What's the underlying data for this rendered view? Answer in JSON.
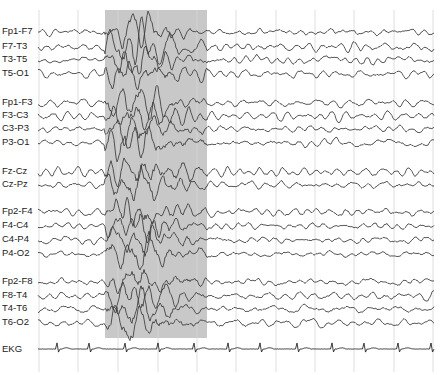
{
  "figure": {
    "type": "eeg-montage",
    "background": "#ffffff",
    "trace_color": "#3a3a3a",
    "gridline_color": "#d6d6d6",
    "highlight_color": "#c8c8c8",
    "highlight_region": {
      "x_start": 105,
      "x_end": 207,
      "y_start": 10,
      "y_end": 338
    },
    "trace_x_start": 38,
    "trace_x_end": 434,
    "gridlines_x": [
      39,
      78,
      118,
      158,
      197,
      236,
      276,
      315,
      354,
      394,
      433
    ],
    "gridline_y_start": 10,
    "gridline_y_end": 372
  },
  "channels": [
    {
      "label": "Fp1-F7",
      "y": 32,
      "group": "left-temporal"
    },
    {
      "label": "F7-T3",
      "y": 47,
      "group": "left-temporal"
    },
    {
      "label": "T3-T5",
      "y": 60,
      "group": "left-temporal"
    },
    {
      "label": "T5-O1",
      "y": 74,
      "group": "left-temporal"
    },
    {
      "label": "Fp1-F3",
      "y": 103,
      "group": "left-parasagittal"
    },
    {
      "label": "F3-C3",
      "y": 116,
      "group": "left-parasagittal"
    },
    {
      "label": "C3-P3",
      "y": 129,
      "group": "left-parasagittal"
    },
    {
      "label": "P3-O1",
      "y": 143,
      "group": "left-parasagittal"
    },
    {
      "label": "Fz-Cz",
      "y": 172,
      "group": "midline"
    },
    {
      "label": "Cz-Pz",
      "y": 185,
      "group": "midline"
    },
    {
      "label": "Fp2-F4",
      "y": 212,
      "group": "right-parasagittal"
    },
    {
      "label": "F4-C4",
      "y": 226,
      "group": "right-parasagittal"
    },
    {
      "label": "C4-P4",
      "y": 240,
      "group": "right-parasagittal"
    },
    {
      "label": "P4-O2",
      "y": 254,
      "group": "right-parasagittal"
    },
    {
      "label": "Fp2-F8",
      "y": 282,
      "group": "right-temporal"
    },
    {
      "label": "F8-T4",
      "y": 296,
      "group": "right-temporal"
    },
    {
      "label": "T4-T6",
      "y": 309,
      "group": "right-temporal"
    },
    {
      "label": "T6-O2",
      "y": 323,
      "group": "right-temporal"
    }
  ],
  "ekg": {
    "label": "EKG",
    "y": 349,
    "spike_x": [
      57,
      89,
      125,
      158,
      194,
      228,
      260,
      297,
      332,
      364,
      398,
      431
    ]
  }
}
